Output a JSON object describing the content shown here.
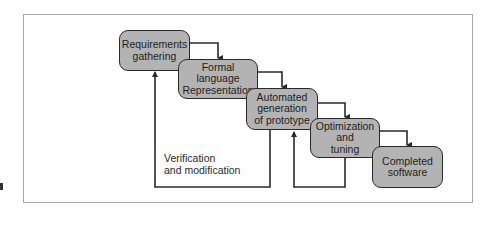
{
  "diagram": {
    "title": "",
    "colors": {
      "box_fill": "#b3b3b3",
      "box_border": "#2a2a2a",
      "line": "#2a2a2a",
      "frame": "#a8a8a8"
    },
    "steps": [
      {
        "id": "requirements",
        "label": "Requirements\ngathering"
      },
      {
        "id": "formal-language",
        "label": "Formal language\nRepresentation"
      },
      {
        "id": "automated-generation",
        "label": "Automated\ngeneration\nof prototype"
      },
      {
        "id": "optimization",
        "label": "Optimization\nand\ntuning"
      },
      {
        "id": "completed",
        "label": "Completed\nsoftware"
      }
    ],
    "edges": [
      {
        "from": "requirements",
        "to": "formal-language",
        "type": "forward"
      },
      {
        "from": "formal-language",
        "to": "automated-generation",
        "type": "forward"
      },
      {
        "from": "automated-generation",
        "to": "optimization",
        "type": "forward"
      },
      {
        "from": "optimization",
        "to": "completed",
        "type": "forward"
      },
      {
        "from": "automated-generation",
        "to": "requirements",
        "type": "feedback"
      },
      {
        "from": "optimization",
        "to": "automated-generation",
        "type": "feedback"
      }
    ],
    "feedback_label": "Verification\nand modification"
  }
}
